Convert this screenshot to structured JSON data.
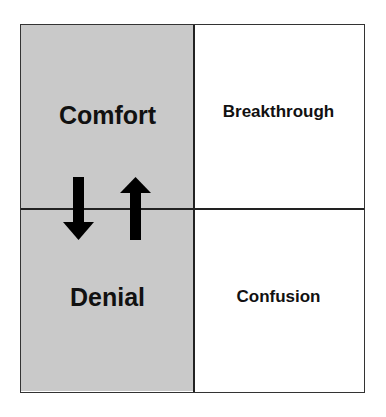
{
  "diagram": {
    "quadrants": {
      "top_left": {
        "label": "Comfort",
        "fill": "#c9c9c9"
      },
      "top_right": {
        "label": "Breakthrough",
        "fill": "#ffffff"
      },
      "bottom_left": {
        "label": "Denial",
        "fill": "#c9c9c9"
      },
      "bottom_right": {
        "label": "Confusion",
        "fill": "#ffffff"
      }
    },
    "arrows": [
      {
        "direction": "down",
        "meaning": "comfort-to-denial"
      },
      {
        "direction": "up",
        "meaning": "denial-to-comfort"
      }
    ]
  }
}
